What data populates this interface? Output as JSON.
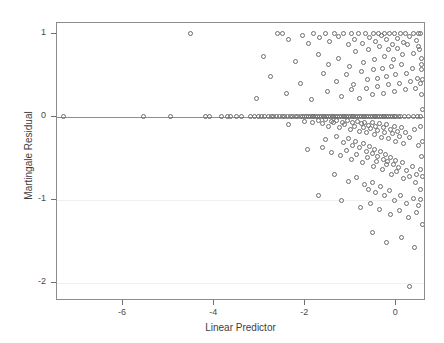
{
  "chart_data": {
    "type": "scatter",
    "title": "",
    "xlabel": "Linear Predictor",
    "ylabel": "Martingale Residual",
    "xlim": [
      -7.45,
      0.65
    ],
    "ylim": [
      -2.22,
      1.13
    ],
    "xticks": [
      -6,
      -4,
      -2,
      0
    ],
    "xticklabels": [
      "-6",
      "-4",
      "-2",
      "0"
    ],
    "yticks": [
      1,
      0,
      -1,
      -2
    ],
    "yticklabels": [
      "1",
      "0",
      "-1",
      "-2"
    ],
    "grid": "horizontal-faint",
    "legend": "none",
    "marker": "open-circle",
    "marker_color": "#6d6d6d",
    "reference_lines": [
      {
        "orientation": "horizontal",
        "value": 0,
        "style": "solid",
        "color": "#8e8e8e"
      }
    ],
    "gridline_values": [
      -1,
      -2
    ],
    "series": [
      {
        "name": "residuals",
        "points": [
          [
            -7.3,
            0.0
          ],
          [
            -5.55,
            0.0
          ],
          [
            -4.95,
            0.0
          ],
          [
            -4.5,
            1.0
          ],
          [
            -4.18,
            0.0
          ],
          [
            -4.1,
            0.0
          ],
          [
            -3.82,
            0.0
          ],
          [
            -3.7,
            0.0
          ],
          [
            -3.62,
            0.0
          ],
          [
            -3.5,
            0.0
          ],
          [
            -3.38,
            0.0
          ],
          [
            -3.2,
            0.0
          ],
          [
            -3.1,
            0.0
          ],
          [
            -3.02,
            0.0
          ],
          [
            -2.95,
            0.0
          ],
          [
            -2.88,
            0.0
          ],
          [
            -2.8,
            0.0
          ],
          [
            -2.74,
            0.0
          ],
          [
            -2.68,
            0.0
          ],
          [
            -2.62,
            0.0
          ],
          [
            -2.56,
            0.0
          ],
          [
            -2.5,
            0.0
          ],
          [
            -2.44,
            0.0
          ],
          [
            -2.38,
            0.0
          ],
          [
            -2.32,
            0.0
          ],
          [
            -2.26,
            0.0
          ],
          [
            -2.2,
            0.0
          ],
          [
            -2.15,
            0.0
          ],
          [
            -2.1,
            0.0
          ],
          [
            -2.05,
            0.0
          ],
          [
            -2.0,
            0.0
          ],
          [
            -1.96,
            0.0
          ],
          [
            -1.92,
            0.0
          ],
          [
            -1.88,
            0.0
          ],
          [
            -1.84,
            0.0
          ],
          [
            -1.8,
            0.0
          ],
          [
            -1.76,
            0.0
          ],
          [
            -1.72,
            0.0
          ],
          [
            -1.68,
            0.0
          ],
          [
            -1.64,
            0.0
          ],
          [
            -1.6,
            0.0
          ],
          [
            -1.56,
            0.0
          ],
          [
            -1.52,
            0.0
          ],
          [
            -1.48,
            0.0
          ],
          [
            -1.44,
            0.0
          ],
          [
            -1.4,
            0.0
          ],
          [
            -1.36,
            0.0
          ],
          [
            -1.32,
            0.0
          ],
          [
            -1.28,
            0.0
          ],
          [
            -1.24,
            0.0
          ],
          [
            -1.2,
            0.0
          ],
          [
            -1.16,
            0.0
          ],
          [
            -1.12,
            0.0
          ],
          [
            -1.08,
            0.0
          ],
          [
            -1.04,
            0.0
          ],
          [
            -1.0,
            0.0
          ],
          [
            -0.96,
            0.0
          ],
          [
            -0.92,
            0.0
          ],
          [
            -0.88,
            0.0
          ],
          [
            -0.84,
            0.0
          ],
          [
            -0.8,
            0.0
          ],
          [
            -0.76,
            0.0
          ],
          [
            -0.72,
            0.0
          ],
          [
            -0.68,
            0.0
          ],
          [
            -0.64,
            0.0
          ],
          [
            -0.6,
            0.0
          ],
          [
            -0.56,
            0.0
          ],
          [
            -0.52,
            0.0
          ],
          [
            -0.48,
            0.0
          ],
          [
            -0.44,
            0.0
          ],
          [
            -0.4,
            0.0
          ],
          [
            -0.36,
            0.0
          ],
          [
            -0.32,
            0.0
          ],
          [
            -0.28,
            0.0
          ],
          [
            -0.24,
            0.0
          ],
          [
            -0.2,
            0.0
          ],
          [
            -0.16,
            0.0
          ],
          [
            -0.12,
            0.0
          ],
          [
            -0.08,
            0.0
          ],
          [
            -0.04,
            0.0
          ],
          [
            0.0,
            0.0
          ],
          [
            0.05,
            0.0
          ],
          [
            0.1,
            0.0
          ],
          [
            0.18,
            0.0
          ],
          [
            0.28,
            0.0
          ],
          [
            0.38,
            0.0
          ],
          [
            0.48,
            0.0
          ],
          [
            0.55,
            0.0
          ],
          [
            -2.35,
            -0.1
          ],
          [
            -2.0,
            -0.06
          ],
          [
            -1.82,
            -0.07
          ],
          [
            -1.7,
            -0.05
          ],
          [
            -1.62,
            -0.09
          ],
          [
            -1.55,
            -0.04
          ],
          [
            -1.48,
            -0.12
          ],
          [
            -1.42,
            -0.06
          ],
          [
            -1.36,
            -0.08
          ],
          [
            -1.3,
            -0.05
          ],
          [
            -1.24,
            -0.14
          ],
          [
            -1.18,
            -0.07
          ],
          [
            -1.12,
            -0.1
          ],
          [
            -1.06,
            -0.05
          ],
          [
            -1.0,
            -0.16
          ],
          [
            -0.95,
            -0.08
          ],
          [
            -0.9,
            -0.12
          ],
          [
            -0.85,
            -0.06
          ],
          [
            -0.8,
            -0.18
          ],
          [
            -0.76,
            -0.09
          ],
          [
            -0.72,
            -0.13
          ],
          [
            -0.68,
            -0.07
          ],
          [
            -0.64,
            -0.2
          ],
          [
            -0.6,
            -0.11
          ],
          [
            -0.56,
            -0.15
          ],
          [
            -0.52,
            -0.08
          ],
          [
            -0.48,
            -0.22
          ],
          [
            -0.44,
            -0.12
          ],
          [
            -0.4,
            -0.17
          ],
          [
            -0.36,
            -0.09
          ],
          [
            -0.32,
            -0.25
          ],
          [
            -0.28,
            -0.14
          ],
          [
            -0.24,
            -0.19
          ],
          [
            -0.2,
            -0.1
          ],
          [
            -0.16,
            -0.27
          ],
          [
            -0.12,
            -0.16
          ],
          [
            -0.08,
            -0.21
          ],
          [
            -0.04,
            -0.12
          ],
          [
            0.0,
            -0.3
          ],
          [
            0.04,
            -0.18
          ],
          [
            0.08,
            -0.24
          ],
          [
            0.12,
            -0.14
          ],
          [
            0.16,
            -0.33
          ],
          [
            0.22,
            -0.2
          ],
          [
            0.3,
            -0.26
          ],
          [
            0.4,
            -0.16
          ],
          [
            0.5,
            -0.35
          ],
          [
            -1.55,
            -0.28
          ],
          [
            -1.3,
            -0.24
          ],
          [
            -1.15,
            -0.32
          ],
          [
            -1.05,
            -0.27
          ],
          [
            -0.95,
            -0.35
          ],
          [
            -0.88,
            -0.3
          ],
          [
            -0.8,
            -0.38
          ],
          [
            -0.72,
            -0.33
          ],
          [
            -0.65,
            -0.42
          ],
          [
            -0.58,
            -0.36
          ],
          [
            -0.52,
            -0.45
          ],
          [
            -0.46,
            -0.4
          ],
          [
            -0.4,
            -0.48
          ],
          [
            -0.34,
            -0.43
          ],
          [
            -0.28,
            -0.52
          ],
          [
            -0.22,
            -0.46
          ],
          [
            -0.18,
            -0.55
          ],
          [
            -0.12,
            -0.5
          ],
          [
            -0.06,
            -0.58
          ],
          [
            0.0,
            -0.53
          ],
          [
            0.06,
            -0.62
          ],
          [
            0.14,
            -0.56
          ],
          [
            0.24,
            -0.65
          ],
          [
            0.36,
            -0.6
          ],
          [
            0.46,
            -0.7
          ],
          [
            0.55,
            -0.64
          ],
          [
            -1.95,
            -0.4
          ],
          [
            -1.62,
            -0.38
          ],
          [
            -1.42,
            -0.44
          ],
          [
            -1.22,
            -0.47
          ],
          [
            -1.08,
            -0.41
          ],
          [
            -0.98,
            -0.52
          ],
          [
            -0.86,
            -0.46
          ],
          [
            -0.74,
            -0.56
          ],
          [
            -0.62,
            -0.5
          ],
          [
            -0.5,
            -0.6
          ],
          [
            -0.42,
            -0.54
          ],
          [
            -0.3,
            -0.64
          ],
          [
            -0.2,
            -0.58
          ],
          [
            -0.1,
            -0.7
          ],
          [
            0.02,
            -0.66
          ],
          [
            0.16,
            -0.75
          ],
          [
            0.3,
            -0.72
          ],
          [
            0.44,
            -0.8
          ],
          [
            0.54,
            -0.88
          ],
          [
            -1.35,
            -0.7
          ],
          [
            -1.05,
            -0.78
          ],
          [
            -0.86,
            -0.74
          ],
          [
            -0.7,
            -0.82
          ],
          [
            -0.6,
            -0.88
          ],
          [
            -0.52,
            -0.8
          ],
          [
            -0.44,
            -0.92
          ],
          [
            -0.34,
            -0.85
          ],
          [
            -0.24,
            -0.95
          ],
          [
            -0.14,
            -0.9
          ],
          [
            -0.02,
            -1.02
          ],
          [
            0.1,
            -0.96
          ],
          [
            0.24,
            -1.05
          ],
          [
            0.38,
            -0.99
          ],
          [
            0.5,
            -1.08
          ],
          [
            -1.7,
            -0.95
          ],
          [
            -1.2,
            -1.02
          ],
          [
            -0.78,
            -1.1
          ],
          [
            -0.56,
            -1.05
          ],
          [
            -0.36,
            -1.12
          ],
          [
            -0.12,
            -1.18
          ],
          [
            0.08,
            -1.14
          ],
          [
            0.28,
            -1.22
          ],
          [
            0.46,
            -1.16
          ],
          [
            -0.52,
            -1.4
          ],
          [
            -0.2,
            -1.52
          ],
          [
            0.12,
            -1.46
          ],
          [
            0.4,
            -1.58
          ],
          [
            0.3,
            -2.05
          ],
          [
            -2.6,
            1.0
          ],
          [
            -2.48,
            1.0
          ],
          [
            -2.35,
            0.92
          ],
          [
            -2.05,
            0.97
          ],
          [
            -1.92,
            0.88
          ],
          [
            -1.8,
            1.0
          ],
          [
            -1.68,
            0.95
          ],
          [
            -1.55,
            1.0
          ],
          [
            -1.45,
            0.9
          ],
          [
            -1.35,
            1.0
          ],
          [
            -1.25,
            0.96
          ],
          [
            -1.15,
            1.0
          ],
          [
            -1.05,
            0.86
          ],
          [
            -0.98,
            1.0
          ],
          [
            -0.9,
            0.93
          ],
          [
            -0.82,
            1.0
          ],
          [
            -0.74,
            0.88
          ],
          [
            -0.66,
            1.0
          ],
          [
            -0.58,
            0.95
          ],
          [
            -0.5,
            1.0
          ],
          [
            -0.44,
            0.9
          ],
          [
            -0.38,
            1.0
          ],
          [
            -0.32,
            0.97
          ],
          [
            -0.26,
            1.0
          ],
          [
            -0.2,
            0.92
          ],
          [
            -0.14,
            1.0
          ],
          [
            -0.08,
            0.86
          ],
          [
            -0.02,
            1.0
          ],
          [
            0.04,
            0.94
          ],
          [
            0.1,
            1.0
          ],
          [
            0.16,
            0.89
          ],
          [
            0.22,
            1.0
          ],
          [
            0.3,
            0.96
          ],
          [
            0.38,
            1.0
          ],
          [
            0.46,
            0.91
          ],
          [
            0.54,
            1.0
          ],
          [
            -2.9,
            0.72
          ],
          [
            -2.2,
            0.66
          ],
          [
            -1.7,
            0.74
          ],
          [
            -1.48,
            0.62
          ],
          [
            -1.25,
            0.7
          ],
          [
            -1.02,
            0.6
          ],
          [
            -0.88,
            0.78
          ],
          [
            -0.72,
            0.65
          ],
          [
            -0.6,
            0.8
          ],
          [
            -0.48,
            0.68
          ],
          [
            -0.36,
            0.84
          ],
          [
            -0.26,
            0.72
          ],
          [
            -0.16,
            0.8
          ],
          [
            -0.06,
            0.68
          ],
          [
            0.04,
            0.82
          ],
          [
            0.14,
            0.74
          ],
          [
            0.26,
            0.86
          ],
          [
            0.38,
            0.76
          ],
          [
            0.5,
            0.84
          ],
          [
            0.56,
            0.7
          ],
          [
            -2.75,
            0.48
          ],
          [
            -2.1,
            0.4
          ],
          [
            -1.6,
            0.52
          ],
          [
            -1.3,
            0.42
          ],
          [
            -1.08,
            0.5
          ],
          [
            -0.92,
            0.38
          ],
          [
            -0.76,
            0.54
          ],
          [
            -0.62,
            0.44
          ],
          [
            -0.5,
            0.56
          ],
          [
            -0.4,
            0.46
          ],
          [
            -0.3,
            0.58
          ],
          [
            -0.2,
            0.48
          ],
          [
            -0.1,
            0.6
          ],
          [
            0.0,
            0.5
          ],
          [
            0.12,
            0.62
          ],
          [
            0.24,
            0.52
          ],
          [
            0.36,
            0.58
          ],
          [
            0.48,
            0.46
          ],
          [
            0.56,
            0.56
          ],
          [
            -3.05,
            0.22
          ],
          [
            -2.4,
            0.28
          ],
          [
            -1.85,
            0.2
          ],
          [
            -1.5,
            0.3
          ],
          [
            -1.2,
            0.24
          ],
          [
            -0.98,
            0.32
          ],
          [
            -0.8,
            0.22
          ],
          [
            -0.64,
            0.34
          ],
          [
            -0.52,
            0.26
          ],
          [
            -0.4,
            0.36
          ],
          [
            -0.28,
            0.28
          ],
          [
            -0.16,
            0.38
          ],
          [
            -0.04,
            0.3
          ],
          [
            0.08,
            0.4
          ],
          [
            0.2,
            0.32
          ],
          [
            0.32,
            0.42
          ],
          [
            0.44,
            0.34
          ],
          [
            0.54,
            0.4
          ],
          [
            0.5,
            1.0
          ],
          [
            0.52,
            0.8
          ],
          [
            0.56,
            0.62
          ],
          [
            0.58,
            0.44
          ],
          [
            0.56,
            0.26
          ],
          [
            0.58,
            0.08
          ],
          [
            0.54,
            -0.12
          ],
          [
            0.58,
            -0.3
          ],
          [
            0.56,
            -0.48
          ],
          [
            0.58,
            -0.72
          ],
          [
            0.54,
            -1.0
          ],
          [
            0.58,
            -1.3
          ]
        ]
      }
    ]
  }
}
